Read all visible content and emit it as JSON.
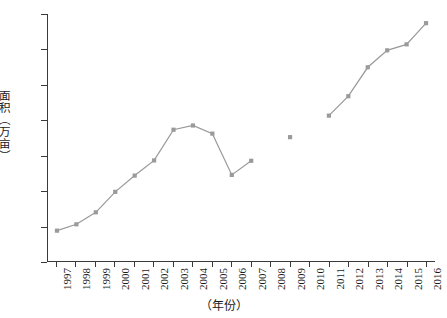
{
  "chart_data": {
    "type": "line",
    "title": "",
    "xlabel": "（年份）",
    "ylabel": "面积（万亩）",
    "xlim": [
      1997,
      2016
    ],
    "ylim": [
      0,
      3500
    ],
    "grid": false,
    "legend": "none",
    "y_ticks": [
      0,
      500,
      1000,
      1500,
      2000,
      2500,
      3000,
      3500
    ],
    "y_tick_labels": [
      "0",
      "500",
      "1 000",
      "1 500",
      "2 000",
      "2 500",
      "3 000",
      "3 500"
    ],
    "categories": [
      "1997",
      "1998",
      "1999",
      "2000",
      "2001",
      "2002",
      "2003",
      "2004",
      "2005",
      "2006",
      "2007",
      "2008",
      "2009",
      "2010",
      "2011",
      "2012",
      "2013",
      "2014",
      "2015",
      "2016"
    ],
    "series": [
      {
        "name": "面积",
        "marker": "square",
        "color": "#9a9a9a",
        "values": [
          430,
          520,
          690,
          980,
          1210,
          1425,
          1860,
          1920,
          1805,
          1220,
          1420,
          null,
          1755,
          null,
          2060,
          2335,
          2745,
          2985,
          3070,
          3370
        ]
      }
    ],
    "segments": [
      {
        "from": "1997",
        "to": "2007",
        "connected": true
      },
      {
        "from": "2009",
        "to": "2009",
        "connected": false
      },
      {
        "from": "2011",
        "to": "2016",
        "connected": true
      }
    ],
    "missing_years": [
      "2008",
      "2010"
    ]
  }
}
